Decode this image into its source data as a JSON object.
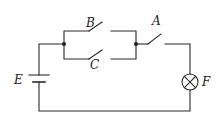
{
  "diagram": {
    "type": "circuit",
    "components": {
      "battery": {
        "label": "E",
        "kind": "cell"
      },
      "switch_a": {
        "label": "A",
        "kind": "switch",
        "state": "open"
      },
      "switch_b": {
        "label": "B",
        "kind": "switch",
        "state": "open"
      },
      "switch_c": {
        "label": "C",
        "kind": "switch",
        "state": "open"
      },
      "lamp": {
        "label": "F",
        "kind": "lamp"
      }
    },
    "topology": "Switches B and C in parallel, in series with switch A, lamp F and cell E",
    "colors": {
      "line": "#2a2a2a",
      "background": "#ffffff"
    }
  }
}
